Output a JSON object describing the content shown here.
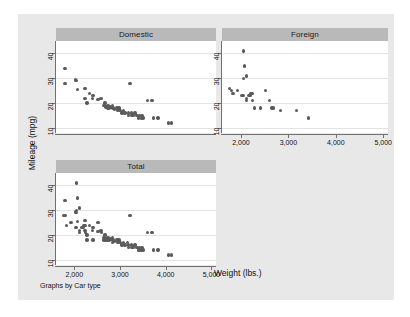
{
  "figure": {
    "note": "Graphs by Car type",
    "xlabel": "Weight (lbs.)",
    "ylabel": "Mileage (mpg)",
    "background_color": "#e8e8e8",
    "plot_background_color": "#ffffff",
    "title_band_color": "#b9b9b9",
    "marker_color": "#5a5a5a",
    "grid_color": "#e3e3e3",
    "axis_color": "#707070"
  },
  "chart_data": {
    "type": "scatter",
    "title": "",
    "xlabel": "Weight (lbs.)",
    "ylabel": "Mileage (mpg)",
    "note": "Graphs by Car type",
    "grid": true,
    "grid_axis": "y",
    "legend_position": "none",
    "xlim": [
      1600,
      5100
    ],
    "ylim": [
      8,
      45
    ],
    "xticks": [
      2000,
      3000,
      4000,
      5000
    ],
    "xtick_labels": [
      "2,000",
      "3,000",
      "4,000",
      "5,000"
    ],
    "yticks": [
      10,
      20,
      30,
      40
    ],
    "ytick_labels": [
      "10",
      "20",
      "30",
      "40"
    ],
    "panels": [
      {
        "title": "Domestic",
        "points": [
          [
            1800,
            34
          ],
          [
            1800,
            28
          ],
          [
            2020,
            29.5
          ],
          [
            2040,
            29
          ],
          [
            2070,
            25.5
          ],
          [
            2230,
            26
          ],
          [
            2230,
            22
          ],
          [
            2280,
            20
          ],
          [
            2330,
            24
          ],
          [
            2400,
            22
          ],
          [
            2410,
            23
          ],
          [
            2520,
            21.5
          ],
          [
            2580,
            22
          ],
          [
            2650,
            19
          ],
          [
            2670,
            20
          ],
          [
            2690,
            18.5
          ],
          [
            2720,
            19
          ],
          [
            2740,
            18
          ],
          [
            2750,
            19
          ],
          [
            2760,
            18
          ],
          [
            2790,
            18.5
          ],
          [
            2830,
            19
          ],
          [
            2850,
            18
          ],
          [
            2880,
            17.5
          ],
          [
            2930,
            18
          ],
          [
            2950,
            17
          ],
          [
            2980,
            18
          ],
          [
            3000,
            17
          ],
          [
            3040,
            16
          ],
          [
            3080,
            17
          ],
          [
            3110,
            16
          ],
          [
            3180,
            16
          ],
          [
            3190,
            15
          ],
          [
            3220,
            28
          ],
          [
            3250,
            16
          ],
          [
            3260,
            15
          ],
          [
            3300,
            15
          ],
          [
            3330,
            16
          ],
          [
            3370,
            15
          ],
          [
            3400,
            14
          ],
          [
            3420,
            15
          ],
          [
            3470,
            14
          ],
          [
            3480,
            15
          ],
          [
            3500,
            14
          ],
          [
            3600,
            21
          ],
          [
            3700,
            21
          ],
          [
            3730,
            14
          ],
          [
            3830,
            14
          ],
          [
            4060,
            12
          ],
          [
            4130,
            12
          ]
        ]
      },
      {
        "title": "Foreign",
        "points": [
          [
            2050,
            41
          ],
          [
            2070,
            35
          ],
          [
            2050,
            30
          ],
          [
            2120,
            31
          ],
          [
            1760,
            26
          ],
          [
            1800,
            25
          ],
          [
            1830,
            24
          ],
          [
            1930,
            25
          ],
          [
            2020,
            23
          ],
          [
            2050,
            23
          ],
          [
            2120,
            22
          ],
          [
            2160,
            23
          ],
          [
            2190,
            23
          ],
          [
            2210,
            24
          ],
          [
            2230,
            24
          ],
          [
            2120,
            21
          ],
          [
            2240,
            21
          ],
          [
            2280,
            18
          ],
          [
            2410,
            18
          ],
          [
            2520,
            25
          ],
          [
            2600,
            21
          ],
          [
            2650,
            18
          ],
          [
            2690,
            18
          ],
          [
            2830,
            17
          ],
          [
            3170,
            17
          ],
          [
            3420,
            14
          ]
        ]
      },
      {
        "title": "Total",
        "points": [
          [
            1800,
            34
          ],
          [
            1760,
            28
          ],
          [
            1800,
            28
          ],
          [
            2020,
            29.5
          ],
          [
            2040,
            29
          ],
          [
            2050,
            41
          ],
          [
            2070,
            35
          ],
          [
            2050,
            30
          ],
          [
            2120,
            31
          ],
          [
            2070,
            25.5
          ],
          [
            1830,
            24
          ],
          [
            1930,
            25
          ],
          [
            2020,
            23
          ],
          [
            2050,
            23
          ],
          [
            2120,
            22
          ],
          [
            2160,
            23
          ],
          [
            2190,
            23
          ],
          [
            2210,
            24
          ],
          [
            2230,
            24
          ],
          [
            2230,
            26
          ],
          [
            2230,
            22
          ],
          [
            2280,
            20
          ],
          [
            2120,
            21
          ],
          [
            2240,
            21
          ],
          [
            2280,
            18
          ],
          [
            2330,
            24
          ],
          [
            2400,
            22
          ],
          [
            2410,
            23
          ],
          [
            2410,
            18
          ],
          [
            2520,
            21.5
          ],
          [
            2520,
            25
          ],
          [
            2580,
            22
          ],
          [
            2600,
            21
          ],
          [
            2650,
            19
          ],
          [
            2650,
            18
          ],
          [
            2670,
            20
          ],
          [
            2690,
            18.5
          ],
          [
            2690,
            18
          ],
          [
            2720,
            19
          ],
          [
            2740,
            18
          ],
          [
            2750,
            19
          ],
          [
            2760,
            18
          ],
          [
            2790,
            18.5
          ],
          [
            2830,
            19
          ],
          [
            2830,
            17
          ],
          [
            2850,
            18
          ],
          [
            2880,
            17.5
          ],
          [
            2930,
            18
          ],
          [
            2950,
            17
          ],
          [
            2980,
            18
          ],
          [
            3000,
            17
          ],
          [
            3040,
            16
          ],
          [
            3080,
            17
          ],
          [
            3110,
            16
          ],
          [
            3170,
            17
          ],
          [
            3180,
            16
          ],
          [
            3190,
            15
          ],
          [
            3220,
            28
          ],
          [
            3250,
            16
          ],
          [
            3260,
            15
          ],
          [
            3300,
            15
          ],
          [
            3330,
            16
          ],
          [
            3370,
            15
          ],
          [
            3400,
            14
          ],
          [
            3420,
            15
          ],
          [
            3420,
            14
          ],
          [
            3470,
            14
          ],
          [
            3480,
            15
          ],
          [
            3500,
            14
          ],
          [
            3600,
            21
          ],
          [
            3700,
            21
          ],
          [
            3730,
            14
          ],
          [
            3830,
            14
          ],
          [
            4060,
            12
          ],
          [
            4130,
            12
          ]
        ]
      }
    ]
  }
}
